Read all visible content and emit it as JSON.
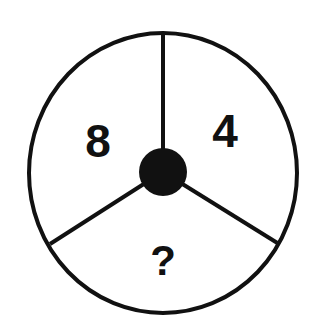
{
  "puzzle": {
    "type": "number-wheel",
    "segments": [
      {
        "position": "upper-left",
        "value": "8"
      },
      {
        "position": "upper-right",
        "value": "4"
      },
      {
        "position": "bottom",
        "value": "?"
      }
    ]
  },
  "colors": {
    "stroke": "#111111",
    "hub": "#111111",
    "background": "#ffffff"
  }
}
